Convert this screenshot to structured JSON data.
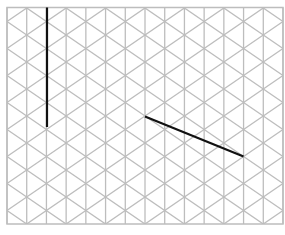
{
  "diagram": {
    "type": "isometric-grid",
    "background_color": "#ffffff",
    "grid": {
      "color": "#bdbdbd",
      "line_width": 1.3,
      "frame": {
        "x0": 7,
        "y0": 7.5,
        "x1": 283,
        "y1": 224
      },
      "columns": 14,
      "node_spacing": 27,
      "odd_column_first_node_y": 8,
      "even_column_first_node_y": 21.5
    },
    "strokes": [
      {
        "name": "vertical-segment",
        "color": "#111111",
        "width": 2.2,
        "from": [
          47,
          7.5
        ],
        "to": [
          47,
          127
        ]
      },
      {
        "name": "diagonal-segment",
        "color": "#111111",
        "width": 2.2,
        "from": [
          145,
          116.5
        ],
        "to": [
          243.5,
          156.5
        ]
      }
    ]
  }
}
